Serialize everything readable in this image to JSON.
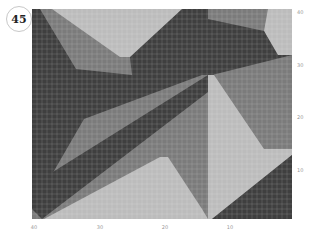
{
  "badge": {
    "number": "45"
  },
  "colors": {
    "dark": "#3f3f3f",
    "medium": "#7b7b7b",
    "light": "#bcbcbc",
    "gridline": "#ffffff"
  },
  "grid": {
    "columns": 52,
    "rows": 42,
    "cell_px": 5
  },
  "axes": {
    "right_ticks": [
      {
        "label": "40",
        "y": 12
      },
      {
        "label": "30",
        "y": 65
      },
      {
        "label": "20",
        "y": 117
      },
      {
        "label": "10",
        "y": 170
      }
    ],
    "bottom_ticks": [
      {
        "label": "40",
        "x": 34
      },
      {
        "label": "30",
        "x": 100
      },
      {
        "label": "20",
        "x": 165
      },
      {
        "label": "10",
        "x": 230
      }
    ]
  },
  "regions": [
    {
      "name": "top-light-triangle",
      "color": "light",
      "points": "20,0 152,0 100,48 88,48"
    },
    {
      "name": "top-right-light",
      "color": "light",
      "points": "236,0 260,0 260,46 244,46 232,22"
    },
    {
      "name": "left-dark-wedge",
      "color": "dark",
      "points": "0,0 8,0 44,60 100,66 170,66 52,110 0,200"
    },
    {
      "name": "upper-dark-band",
      "color": "dark",
      "points": "98,48 150,0 176,0 176,10 232,22 246,46 260,46 180,66 100,66"
    },
    {
      "name": "diagonal-dark-band",
      "color": "dark",
      "points": "0,200 0,176 176,66 182,62 180,80 10,210"
    },
    {
      "name": "center-light-triangle",
      "color": "light",
      "points": "176,66 182,66 232,140 260,140 260,146 180,210 176,210"
    },
    {
      "name": "bottom-light-triangle",
      "color": "light",
      "points": "128,148 136,148 170,200 176,210 12,210"
    },
    {
      "name": "bottom-right-dark",
      "color": "dark",
      "points": "260,146 260,210 180,210"
    }
  ]
}
